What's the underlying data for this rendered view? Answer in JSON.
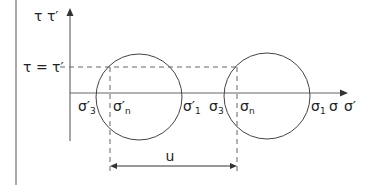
{
  "diagram": {
    "y_axis_label": "τ  τ′",
    "dashed_level_label": "τ = τ′",
    "x_axis_labels": {
      "sigma3_eff": {
        "base": "σ′",
        "sub": "3"
      },
      "sigman_eff": {
        "base": "σ′",
        "sub": "n"
      },
      "sigma1_eff": {
        "base": "σ′",
        "sub": "1"
      },
      "sigma3": {
        "base": "σ",
        "sub": "3"
      },
      "sigman": {
        "base": "σ",
        "sub": "n"
      },
      "sigma1": {
        "base": "σ",
        "sub": "1"
      },
      "sigma": "σ",
      "sigma_eff": "σ′"
    },
    "dimension_label": "u",
    "circles": [
      {
        "name": "effective-stress-circle",
        "cx": 139,
        "cy": 97,
        "r": 43
      },
      {
        "name": "total-stress-circle",
        "cx": 267,
        "cy": 96,
        "r": 43
      }
    ],
    "colors": {
      "axis": "#888888",
      "line": "#444444",
      "dash": "#666666",
      "text": "#222222"
    }
  }
}
